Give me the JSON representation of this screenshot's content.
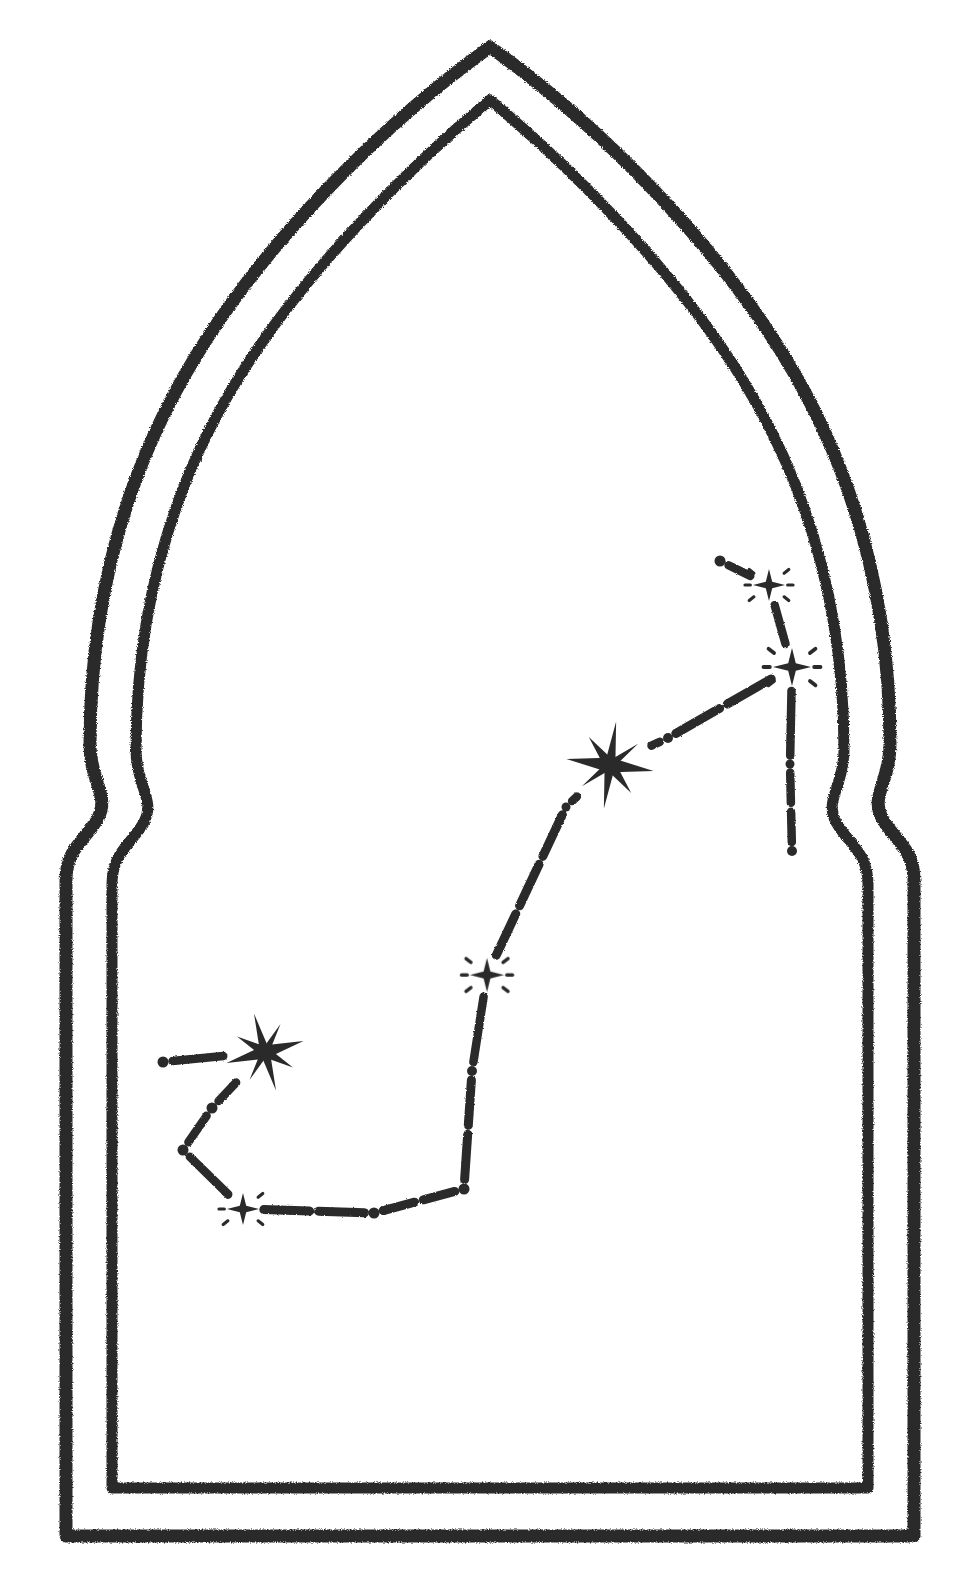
{
  "artwork": {
    "title": "Constellation in an Ogee Arch",
    "medium": "hand-drawn charcoal / pencil line illustration",
    "background_color": "#ffffff",
    "ink_color": "#2b2b2b",
    "canvas": {
      "width": 963,
      "height": 1581
    }
  },
  "frame": {
    "name": "ogee-moorish-arch-double-outline",
    "stroke_color": "#2b2b2b",
    "outer_stroke_width": 13,
    "inner_stroke_width": 11,
    "texture": "rough charcoal, grainy edges",
    "apex": {
      "x": 490,
      "y": 47
    },
    "shoulder_left": {
      "x": 88,
      "y": 800
    },
    "shoulder_right": {
      "x": 880,
      "y": 800
    },
    "base_left": {
      "x": 66,
      "y": 1536
    },
    "base_right": {
      "x": 900,
      "y": 1536
    },
    "outer_path": "M 66 1536 L 66 880 C 66 846 88 836 100 812 C 112 790 90 776 90 742 C 90 560 160 380 270 250 C 340 168 430 92 490 47 C 550 92 640 168 710 250 C 820 380 890 560 890 742 C 890 776 868 790 880 812 C 892 836 914 846 914 880 L 914 1536 Z",
    "inner_path": "M 110 1488 L 110 882 C 110 850 132 840 144 818 C 156 796 134 782 134 748 C 134 574 200 400 304 278 C 370 202 442 136 490 98 C 538 136 610 202 676 278 C 780 400 846 574 846 748 C 846 782 824 796 836 818 C 848 840 870 850 870 882 L 870 1488 Z"
  },
  "chart_data": {
    "type": "scatter",
    "title": "Constellation star map (dot-and-dash asterism)",
    "xlabel": "",
    "ylabel": "",
    "xlim": [
      0,
      963
    ],
    "ylim": [
      0,
      1581
    ],
    "grid": false,
    "legend": "none",
    "coordinate_note": "pixel coordinates within the 963x1581 canvas, origin at top-left",
    "marker_types": {
      "dot": "solid round dot, plain star",
      "sparkle": "small 4-point star with radiating dashes, medium-bright star",
      "starburst": "large 8-point starburst, brightest star"
    },
    "nodes": [
      {
        "id": "n1",
        "label": "node-1",
        "marker": "dot",
        "x": 720,
        "y": 561,
        "size": 11
      },
      {
        "id": "n2",
        "label": "node-2",
        "marker": "sparkle",
        "x": 769,
        "y": 585,
        "size": 16
      },
      {
        "id": "n3",
        "label": "node-3",
        "marker": "sparkle",
        "x": 792,
        "y": 667,
        "size": 19
      },
      {
        "id": "n4",
        "label": "node-4",
        "marker": "dot",
        "x": 790,
        "y": 764,
        "size": 9
      },
      {
        "id": "n5",
        "label": "node-5",
        "marker": "dot",
        "x": 792,
        "y": 851,
        "size": 10
      },
      {
        "id": "n6",
        "label": "node-6",
        "marker": "dot",
        "x": 668,
        "y": 738,
        "size": 10
      },
      {
        "id": "n7",
        "label": "node-7",
        "marker": "starburst",
        "x": 610,
        "y": 765,
        "size": 44
      },
      {
        "id": "n8",
        "label": "node-8",
        "marker": "dot",
        "x": 566,
        "y": 807,
        "size": 9
      },
      {
        "id": "n9",
        "label": "node-9",
        "marker": "sparkle",
        "x": 487,
        "y": 975,
        "size": 17
      },
      {
        "id": "n10",
        "label": "node-10",
        "marker": "dot",
        "x": 472,
        "y": 1071,
        "size": 10
      },
      {
        "id": "n11",
        "label": "node-11",
        "marker": "dot",
        "x": 464,
        "y": 1189,
        "size": 11
      },
      {
        "id": "n12",
        "label": "node-12",
        "marker": "dot",
        "x": 374,
        "y": 1213,
        "size": 11
      },
      {
        "id": "n13",
        "label": "node-13",
        "marker": "sparkle",
        "x": 243,
        "y": 1209,
        "size": 16
      },
      {
        "id": "n14",
        "label": "node-14",
        "marker": "dot",
        "x": 183,
        "y": 1150,
        "size": 11
      },
      {
        "id": "n15",
        "label": "node-15",
        "marker": "dot",
        "x": 212,
        "y": 1108,
        "size": 11
      },
      {
        "id": "n16",
        "label": "node-16",
        "marker": "starburst",
        "x": 265,
        "y": 1052,
        "size": 40
      },
      {
        "id": "n17",
        "label": "node-17",
        "marker": "dot",
        "x": 163,
        "y": 1062,
        "size": 11
      }
    ],
    "edges": [
      {
        "from": "n1",
        "to": "n2",
        "style": "dashed"
      },
      {
        "from": "n2",
        "to": "n3",
        "style": "dashed"
      },
      {
        "from": "n3",
        "to": "n4",
        "style": "dashed"
      },
      {
        "from": "n4",
        "to": "n5",
        "style": "dashed"
      },
      {
        "from": "n3",
        "to": "n6",
        "style": "dashed"
      },
      {
        "from": "n6",
        "to": "n7",
        "style": "dashed"
      },
      {
        "from": "n7",
        "to": "n8",
        "style": "dashed"
      },
      {
        "from": "n8",
        "to": "n9",
        "style": "dashed"
      },
      {
        "from": "n9",
        "to": "n10",
        "style": "dashed"
      },
      {
        "from": "n10",
        "to": "n11",
        "style": "dashed"
      },
      {
        "from": "n11",
        "to": "n12",
        "style": "dashed"
      },
      {
        "from": "n12",
        "to": "n13",
        "style": "dashed"
      },
      {
        "from": "n13",
        "to": "n14",
        "style": "dashed"
      },
      {
        "from": "n14",
        "to": "n15",
        "style": "dashed"
      },
      {
        "from": "n15",
        "to": "n16",
        "style": "dashed"
      },
      {
        "from": "n16",
        "to": "n17",
        "style": "dashed"
      }
    ],
    "counts": {
      "dots": 9,
      "sparkles": 4,
      "starbursts": 2,
      "total_nodes": 17,
      "edges": 16
    }
  }
}
